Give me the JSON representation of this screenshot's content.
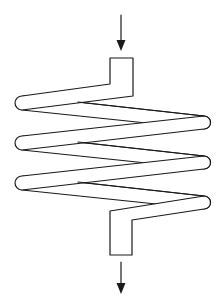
{
  "diagram": {
    "type": "helical-coil-heat-exchanger",
    "flow": {
      "inlet_arrow": "down-arrow",
      "outlet_arrow": "down-arrow"
    },
    "coil": {
      "turns": 3,
      "left_bends": 3,
      "right_bends": 3
    },
    "colors": {
      "stroke": "#1a1a1a",
      "background": "#ffffff"
    }
  }
}
